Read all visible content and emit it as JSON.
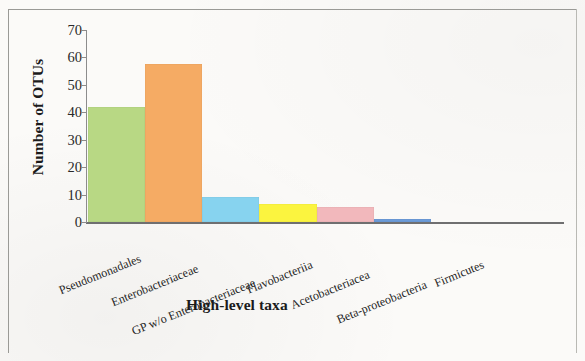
{
  "chart_data": {
    "type": "bar",
    "title": "",
    "subtitle": "",
    "xlabel": "High-level taxa",
    "ylabel": "Number of OTUs",
    "categories": [
      "Pseudomonadales",
      "Enterobacteriaceae",
      "GP w/o Enterobacteriaceae",
      "Flavobacteriia",
      "Acetobacteriacea",
      "Beta-proteobacteria",
      "Firmicutes"
    ],
    "values": [
      42,
      57.5,
      9,
      6.5,
      5.5,
      1,
      0
    ],
    "bar_colors": [
      "#b8d884",
      "#f5ab64",
      "#87d3ef",
      "#fbf43f",
      "#f2b8bc",
      "#6b9bd8",
      "#6b9bd8"
    ],
    "ylim": [
      0,
      70
    ],
    "yticks": [
      0,
      10,
      20,
      30,
      40,
      50,
      60,
      70
    ],
    "ytick_labels": [
      "0",
      "10",
      "20",
      "30",
      "40",
      "50",
      "60",
      "70"
    ],
    "grid": false,
    "legend": "none",
    "xlabel_rotation_deg": -22,
    "bars_contiguous": true
  },
  "figure": {
    "background_color": "#fbfaf8",
    "border_color": "#9a9a96",
    "axis_color": "#6f6f70",
    "text_color": "#1b1b1b"
  }
}
